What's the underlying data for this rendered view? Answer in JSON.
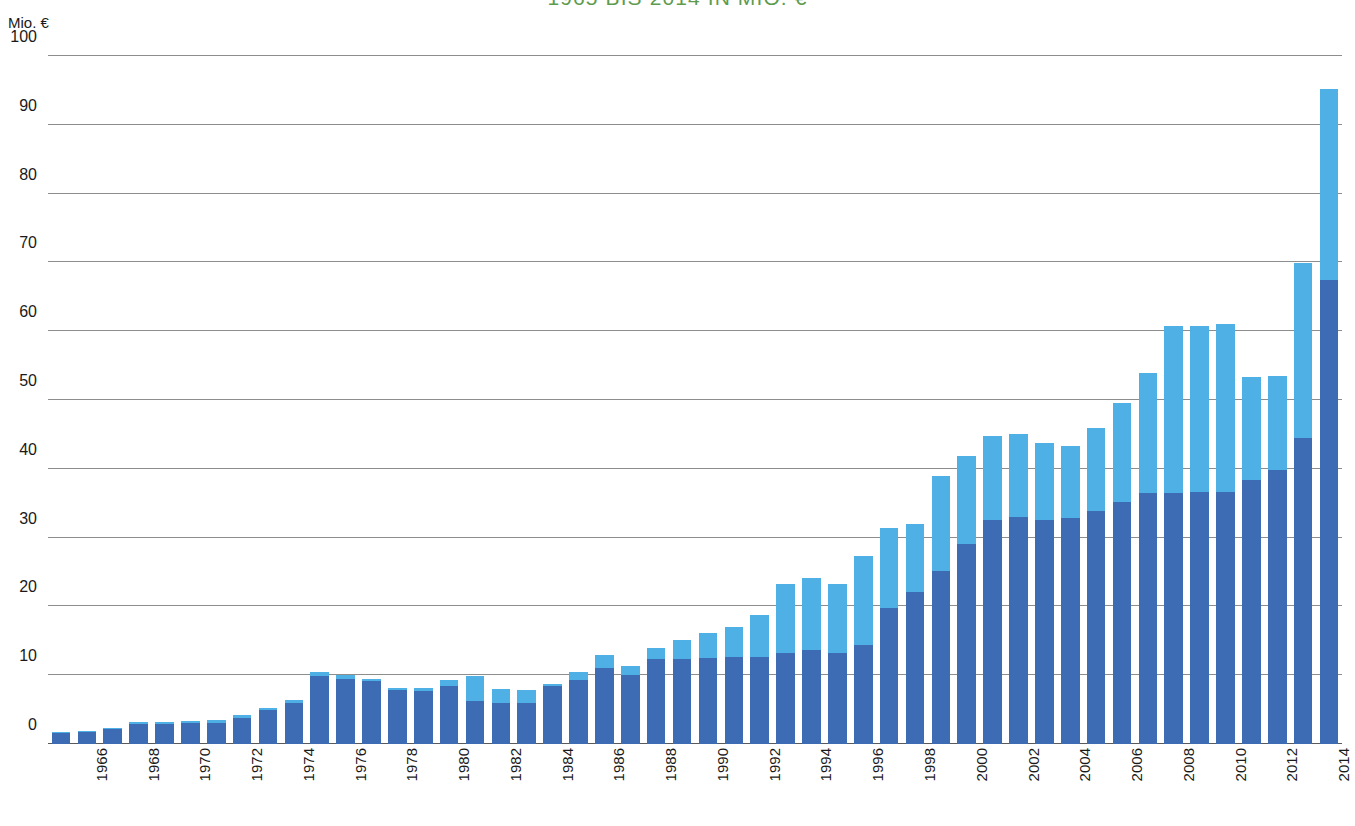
{
  "title": "1965 BIS 2014 IN MIO. €",
  "axis_unit": "Mio. €",
  "colors": {
    "title": "#5e9b4e",
    "series_dark": "#3e6cb4",
    "series_light": "#4fb0e6",
    "gridline": "#8d8d8d",
    "text": "#1a1a1a",
    "background": "#ffffff"
  },
  "chart_data": {
    "type": "bar",
    "stacked": true,
    "title": "1965 BIS 2014 IN MIO. €",
    "xlabel": "",
    "ylabel": "Mio. €",
    "ylim": [
      0,
      100
    ],
    "ytick_step": 10,
    "yticks": [
      0,
      10,
      20,
      30,
      40,
      50,
      60,
      70,
      80,
      90,
      100
    ],
    "ytick_labels": [
      "0",
      "10",
      "20",
      "30",
      "40",
      "50",
      "60",
      "70",
      "80",
      "90",
      "100"
    ],
    "grid": true,
    "legend": false,
    "xtick_interval": 2,
    "xtick_labels": [
      "1966",
      "1968",
      "1970",
      "1972",
      "1974",
      "1976",
      "1978",
      "1980",
      "1982",
      "1984",
      "1986",
      "1988",
      "1990",
      "1992",
      "1994",
      "1996",
      "1998",
      "2000",
      "2002",
      "2004",
      "2006",
      "2008",
      "2010",
      "2012",
      "2014"
    ],
    "categories": [
      "1965",
      "1966",
      "1967",
      "1968",
      "1969",
      "1970",
      "1971",
      "1972",
      "1973",
      "1974",
      "1975",
      "1976",
      "1977",
      "1978",
      "1979",
      "1980",
      "1981",
      "1982",
      "1983",
      "1984",
      "1985",
      "1986",
      "1987",
      "1988",
      "1989",
      "1990",
      "1991",
      "1992",
      "1993",
      "1994",
      "1995",
      "1996",
      "1997",
      "1998",
      "1999",
      "2000",
      "2001",
      "2002",
      "2003",
      "2004",
      "2005",
      "2006",
      "2007",
      "2008",
      "2009",
      "2010",
      "2011",
      "2012",
      "2013",
      "2014"
    ],
    "series": [
      {
        "name": "dark-blue-segment",
        "color": "#3e6cb4",
        "values": [
          1.6,
          1.7,
          2.2,
          2.9,
          2.9,
          3.0,
          3.1,
          3.8,
          4.9,
          6.0,
          9.9,
          9.5,
          9.1,
          7.9,
          7.7,
          8.5,
          6.3,
          6.0,
          6.0,
          8.4,
          9.3,
          11.0,
          10.0,
          12.3,
          12.4,
          12.5,
          12.6,
          12.6,
          13.3,
          13.6,
          13.3,
          14.4,
          19.7,
          22.1,
          25.1,
          29.1,
          32.5,
          33.0,
          32.6,
          32.9,
          33.8,
          35.2,
          36.5,
          36.5,
          36.6,
          36.7,
          38.4,
          39.8,
          44.5,
          67.4
        ]
      },
      {
        "name": "light-blue-segment",
        "color": "#4fb0e6",
        "values": [
          0.2,
          0.2,
          0.2,
          0.3,
          0.3,
          0.4,
          0.4,
          0.4,
          0.4,
          0.4,
          0.5,
          0.5,
          0.4,
          0.3,
          0.4,
          0.8,
          3.6,
          2.0,
          1.9,
          0.3,
          1.1,
          2.0,
          1.4,
          1.6,
          2.7,
          3.7,
          4.4,
          6.1,
          9.9,
          10.5,
          10.0,
          12.9,
          11.7,
          9.9,
          13.8,
          12.8,
          12.3,
          12.1,
          11.2,
          10.4,
          12.1,
          14.3,
          17.4,
          24.2,
          24.2,
          24.3,
          14.9,
          13.7,
          25.4,
          27.8
        ]
      }
    ],
    "totals": [
      1.8,
      1.9,
      2.4,
      3.2,
      3.2,
      3.4,
      3.5,
      4.2,
      5.3,
      6.4,
      10.4,
      10.0,
      9.5,
      8.2,
      8.1,
      9.3,
      9.9,
      8.0,
      7.9,
      8.7,
      10.4,
      13.0,
      11.4,
      13.9,
      15.1,
      16.2,
      17.0,
      18.7,
      23.2,
      24.1,
      23.3,
      27.3,
      31.4,
      32.0,
      38.9,
      41.9,
      44.8,
      45.1,
      43.8,
      43.3,
      45.9,
      49.5,
      53.9,
      60.7,
      60.8,
      61.0,
      53.3,
      53.5,
      69.9,
      95.2
    ]
  }
}
